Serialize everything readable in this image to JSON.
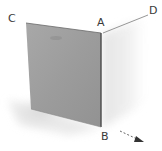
{
  "diagram": {
    "type": "folded-plane-3d",
    "labels": {
      "A": "A",
      "B": "B",
      "C": "C",
      "D": "D"
    },
    "colors": {
      "front_panel": "#9a9a9a",
      "front_panel_light": "#b4b4b4",
      "shadow": "#d8d8d8",
      "edge": "#555555",
      "label": "#3a3a3a",
      "arrow": "#444444"
    },
    "arrow": {
      "style": "dashed",
      "direction": "down-right"
    }
  }
}
